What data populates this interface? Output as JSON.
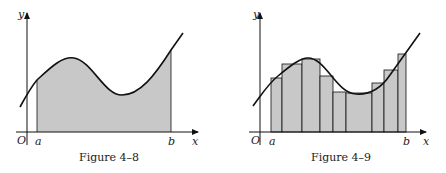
{
  "figures": [
    {
      "caption": "Figure 4–8",
      "x_label": "x",
      "y_label": "y",
      "origin_label": "O",
      "a_label": "a",
      "b_label": "b",
      "description": "Shaded area under curve from a to b"
    },
    {
      "caption": "Figure 4–9",
      "x_label": "x",
      "y_label": "y",
      "origin_label": "O",
      "a_label": "a",
      "b_label": "b",
      "description": "Area approximated by rectangles from a to b"
    }
  ],
  "colors": {
    "shade": "#c8c8c8",
    "line": "#111111"
  }
}
